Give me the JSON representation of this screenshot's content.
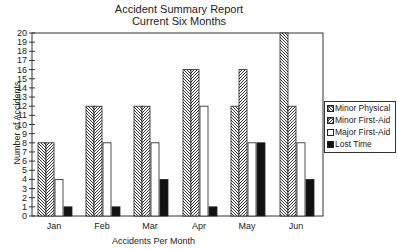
{
  "chart_data": {
    "type": "bar",
    "title": "Accident Summary Report",
    "subtitle": "Current Six Months",
    "xlabel": "Accidents Per Month",
    "ylabel": "Number of Accidents",
    "categories": [
      "Jan",
      "Feb",
      "Mar",
      "Apr",
      "May",
      "Jun"
    ],
    "series": [
      {
        "name": "Minor Physical",
        "pattern": "backslash-hatch",
        "values": [
          8,
          12,
          12,
          16,
          12,
          20
        ]
      },
      {
        "name": "Minor First-Aid",
        "pattern": "slash-hatch",
        "values": [
          8,
          12,
          12,
          16,
          16,
          12
        ]
      },
      {
        "name": "Major First-Aid",
        "pattern": "white",
        "values": [
          4,
          8,
          8,
          12,
          8,
          8
        ]
      },
      {
        "name": "Lost Time",
        "pattern": "black",
        "values": [
          1,
          1,
          4,
          1,
          8,
          4
        ]
      }
    ],
    "ylim": [
      0,
      20
    ],
    "yticks": [
      0,
      1,
      2,
      3,
      4,
      5,
      6,
      7,
      8,
      9,
      10,
      11,
      12,
      13,
      14,
      15,
      16,
      17,
      18,
      19,
      20
    ],
    "grid": false,
    "legend_position": "right"
  }
}
